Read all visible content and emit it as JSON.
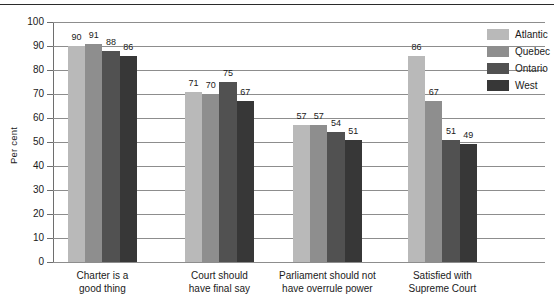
{
  "chart_data": {
    "type": "bar",
    "title": "",
    "subtitle": "",
    "xlabel": "",
    "ylabel": "Per cent",
    "ylim": [
      0,
      100
    ],
    "ytick_step": 10,
    "yticks": [
      0,
      10,
      20,
      30,
      40,
      50,
      60,
      70,
      80,
      90,
      100
    ],
    "grid": true,
    "legend_position": "top-right",
    "categories": [
      "Charter is a\ngood thing",
      "Court should\nhave final say",
      "Parliament should not\nhave overrule power",
      "Satisfied with\nSupreme Court"
    ],
    "series": [
      {
        "name": "Atlantic",
        "color": "#b9b9b9",
        "values": [
          90,
          71,
          57,
          86
        ]
      },
      {
        "name": "Quebec",
        "color": "#8e8e8e",
        "values": [
          91,
          70,
          57,
          67
        ]
      },
      {
        "name": "Ontario",
        "color": "#515151",
        "values": [
          88,
          75,
          54,
          51
        ]
      },
      {
        "name": "West",
        "color": "#373737",
        "values": [
          86,
          67,
          51,
          49
        ]
      }
    ]
  },
  "legend": {
    "items": [
      {
        "label": "Atlantic",
        "color": "#b9b9b9"
      },
      {
        "label": "Quebec",
        "color": "#8e8e8e"
      },
      {
        "label": "Ontario",
        "color": "#515151"
      },
      {
        "label": "West",
        "color": "#373737"
      }
    ]
  },
  "axes": {
    "y_title": "Per cent",
    "y_tick_labels": [
      "100",
      "90",
      "80",
      "70",
      "60",
      "50",
      "40",
      "30",
      "20",
      "10",
      "0"
    ]
  }
}
